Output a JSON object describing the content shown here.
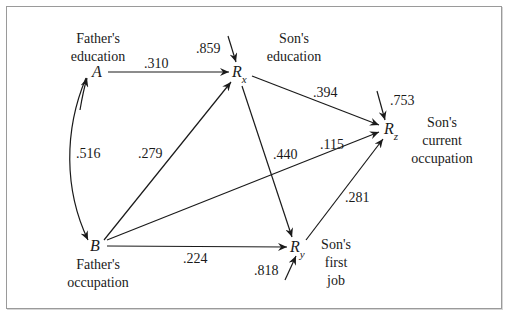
{
  "diagram": {
    "type": "path-diagram",
    "nodes": {
      "A": {
        "symbol": "A",
        "label_line1": "Father's",
        "label_line2": "education"
      },
      "B": {
        "symbol": "B",
        "label_line1": "Father's",
        "label_line2": "occupation"
      },
      "Rx": {
        "symbol": "R",
        "subscript": "x",
        "label_line1": "Son's",
        "label_line2": "education"
      },
      "Ry": {
        "symbol": "R",
        "subscript": "y",
        "label_line1": "Son's",
        "label_line2": "first",
        "label_line3": "job"
      },
      "Rz": {
        "symbol": "R",
        "subscript": "z",
        "label_line1": "Son's",
        "label_line2": "current",
        "label_line3": "occupation"
      }
    },
    "edges": [
      {
        "from": "A",
        "to": "Rx",
        "coefficient": ".310"
      },
      {
        "from": "A",
        "to": "B",
        "coefficient": ".516",
        "kind": "correlation"
      },
      {
        "from": "B",
        "to": "Rx",
        "coefficient": ".279"
      },
      {
        "from": "B",
        "to": "Rz",
        "coefficient": ".115"
      },
      {
        "from": "B",
        "to": "Ry",
        "coefficient": ".224"
      },
      {
        "from": "Rx",
        "to": "Rz",
        "coefficient": ".394"
      },
      {
        "from": "Rx",
        "to": "Ry",
        "coefficient": ".440"
      },
      {
        "from": "Ry",
        "to": "Rz",
        "coefficient": ".281"
      }
    ],
    "residuals": {
      "Rx": ".859",
      "Ry": ".818",
      "Rz": ".753"
    },
    "colors": {
      "ink": "#1a1a1a",
      "frame": "#9a9a9a",
      "background": "#ffffff"
    }
  }
}
